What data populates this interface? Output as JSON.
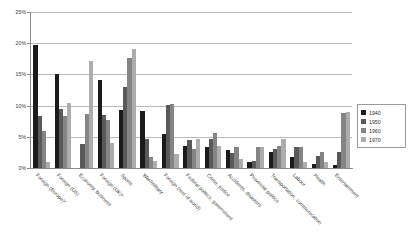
{
  "chart_data": {
    "type": "bar",
    "title": "",
    "xlabel": "",
    "ylabel": "",
    "ylim": [
      0,
      25
    ],
    "ytick_labels": [
      "0%",
      "5%",
      "10%",
      "15%",
      "20%",
      "25%"
    ],
    "ytick_values": [
      0,
      5,
      10,
      15,
      20,
      25
    ],
    "grid": true,
    "legend_position": "right",
    "categories": [
      "Foreign (Europe)*",
      "Foreign (US)",
      "Economy, business",
      "Foreign (UK)*",
      "Sports",
      "War/military",
      "Foreign (rest of world)",
      "Federal politics, government",
      "Crime, justice",
      "Accidents, disasters",
      "Provincial politics",
      "Transportation, communication",
      "Labour",
      "Health",
      "Entertainment"
    ],
    "series": [
      {
        "name": "1940",
        "color": "#1b1b1b",
        "values": [
          19.7,
          15.1,
          0.0,
          14.1,
          9.3,
          9.2,
          5.4,
          3.6,
          3.4,
          2.9,
          1.0,
          2.6,
          1.7,
          0.6,
          0.5
        ]
      },
      {
        "name": "1950",
        "color": "#595959",
        "values": [
          8.3,
          9.4,
          3.8,
          8.5,
          13.0,
          4.7,
          10.1,
          4.5,
          4.7,
          2.4,
          1.1,
          3.0,
          3.4,
          1.9,
          2.6
        ]
      },
      {
        "name": "1960",
        "color": "#848484",
        "values": [
          6.0,
          8.4,
          8.6,
          7.7,
          17.6,
          1.8,
          10.3,
          3.1,
          5.6,
          3.4,
          3.3,
          3.6,
          3.3,
          2.5,
          8.8
        ]
      },
      {
        "name": "1970",
        "color": "#adadad",
        "values": [
          1.0,
          10.4,
          17.2,
          4.0,
          19.0,
          1.2,
          2.3,
          4.6,
          3.6,
          1.5,
          3.4,
          4.6,
          1.0,
          0.9,
          8.9
        ]
      }
    ]
  },
  "legend": {
    "entries": [
      {
        "label": "1940"
      },
      {
        "label": "1950"
      },
      {
        "label": "1960"
      },
      {
        "label": "1970"
      }
    ]
  }
}
